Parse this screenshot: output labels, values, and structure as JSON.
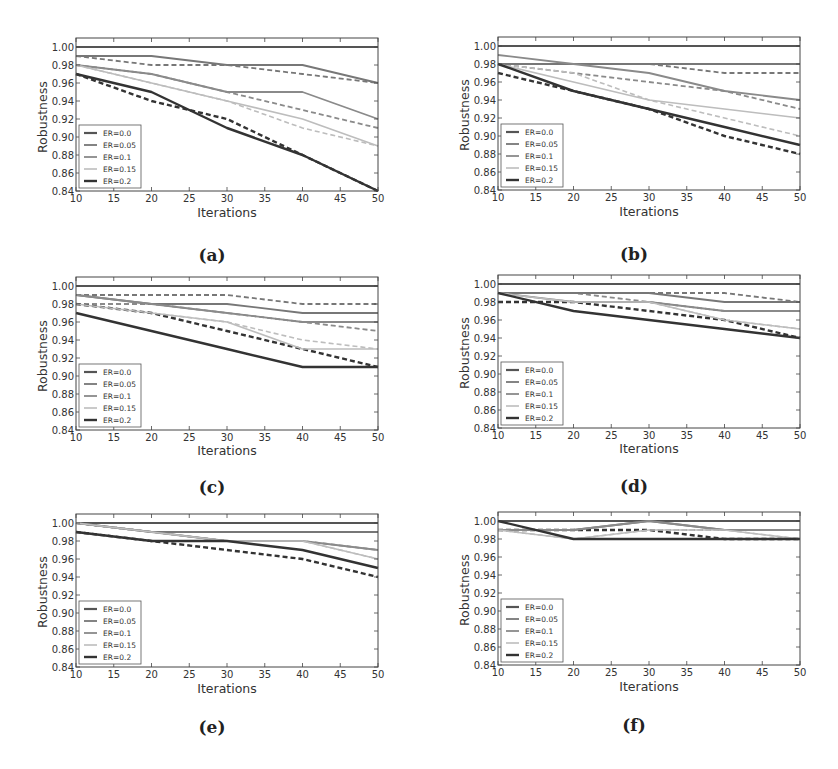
{
  "figure": {
    "panels": [
      "a",
      "b",
      "c",
      "d",
      "e",
      "f"
    ]
  },
  "styles": {
    "series_colors": {
      "ER=0.0": "#555555",
      "ER=0.05": "#777777",
      "ER=0.1": "#8a8a8a",
      "ER=0.15": "#bdbdbd",
      "ER=0.2": "#333333"
    }
  },
  "chart_data": [
    {
      "id": "a",
      "caption": "(a)",
      "type": "line",
      "title": "",
      "xlabel": "Iterations",
      "ylabel": "Robustness",
      "x": [
        10,
        20,
        30,
        40,
        50
      ],
      "xticks": [
        "10",
        "15",
        "20",
        "25",
        "30",
        "35",
        "40",
        "45",
        "50"
      ],
      "yticks": [
        "0.84",
        "0.86",
        "0.88",
        "0.90",
        "0.92",
        "0.94",
        "0.96",
        "0.98",
        "1.00"
      ],
      "xlim": [
        10,
        50
      ],
      "ylim": [
        0.84,
        1.01
      ],
      "grid": false,
      "legend": {
        "position": "lower left",
        "entries": [
          "ER=0.0",
          "ER=0.05",
          "ER=0.1",
          "ER=0.15",
          "ER=0.2"
        ]
      },
      "series": [
        {
          "name": "ER=0.0",
          "style": "solid",
          "values": [
            1.0,
            1.0,
            1.0,
            1.0,
            1.0
          ]
        },
        {
          "name": "ER=0.0",
          "style": "dashed",
          "values": [
            1.0,
            1.0,
            1.0,
            1.0,
            1.0
          ]
        },
        {
          "name": "ER=0.05",
          "style": "solid",
          "values": [
            0.99,
            0.99,
            0.98,
            0.98,
            0.96
          ]
        },
        {
          "name": "ER=0.05",
          "style": "dashed",
          "values": [
            0.99,
            0.98,
            0.98,
            0.97,
            0.96
          ]
        },
        {
          "name": "ER=0.1",
          "style": "solid",
          "values": [
            0.98,
            0.97,
            0.95,
            0.95,
            0.92
          ]
        },
        {
          "name": "ER=0.1",
          "style": "dashed",
          "values": [
            0.98,
            0.97,
            0.95,
            0.93,
            0.91
          ]
        },
        {
          "name": "ER=0.15",
          "style": "solid",
          "values": [
            0.98,
            0.96,
            0.94,
            0.92,
            0.89
          ]
        },
        {
          "name": "ER=0.15",
          "style": "dashed",
          "values": [
            0.98,
            0.96,
            0.94,
            0.91,
            0.89
          ]
        },
        {
          "name": "ER=0.2",
          "style": "solid",
          "values": [
            0.97,
            0.95,
            0.91,
            0.88,
            0.84
          ]
        },
        {
          "name": "ER=0.2",
          "style": "dashed",
          "values": [
            0.97,
            0.94,
            0.92,
            0.88,
            0.84
          ]
        }
      ]
    },
    {
      "id": "b",
      "caption": "(b)",
      "type": "line",
      "title": "",
      "xlabel": "Iterations",
      "ylabel": "Robustness",
      "x": [
        10,
        20,
        30,
        40,
        50
      ],
      "xticks": [
        "10",
        "15",
        "20",
        "25",
        "30",
        "35",
        "40",
        "45",
        "50"
      ],
      "yticks": [
        "0.84",
        "0.86",
        "0.88",
        "0.90",
        "0.92",
        "0.94",
        "0.96",
        "0.98",
        "1.00"
      ],
      "xlim": [
        10,
        50
      ],
      "ylim": [
        0.84,
        1.01
      ],
      "grid": false,
      "legend": {
        "position": "lower left",
        "entries": [
          "ER=0.0",
          "ER=0.05",
          "ER=0.1",
          "ER=0.15",
          "ER=0.2"
        ]
      },
      "series": [
        {
          "name": "ER=0.0",
          "style": "solid",
          "values": [
            1.0,
            1.0,
            1.0,
            1.0,
            1.0
          ]
        },
        {
          "name": "ER=0.0",
          "style": "dashed",
          "values": [
            1.0,
            1.0,
            1.0,
            1.0,
            1.0
          ]
        },
        {
          "name": "ER=0.05",
          "style": "solid",
          "values": [
            0.98,
            0.98,
            0.98,
            0.98,
            0.98
          ]
        },
        {
          "name": "ER=0.05",
          "style": "dashed",
          "values": [
            0.98,
            0.98,
            0.98,
            0.97,
            0.97
          ]
        },
        {
          "name": "ER=0.1",
          "style": "solid",
          "values": [
            0.99,
            0.98,
            0.97,
            0.95,
            0.94
          ]
        },
        {
          "name": "ER=0.1",
          "style": "dashed",
          "values": [
            0.98,
            0.97,
            0.96,
            0.95,
            0.93
          ]
        },
        {
          "name": "ER=0.15",
          "style": "solid",
          "values": [
            0.98,
            0.96,
            0.94,
            0.93,
            0.92
          ]
        },
        {
          "name": "ER=0.15",
          "style": "dashed",
          "values": [
            0.98,
            0.97,
            0.94,
            0.92,
            0.9
          ]
        },
        {
          "name": "ER=0.2",
          "style": "solid",
          "values": [
            0.98,
            0.95,
            0.93,
            0.91,
            0.89
          ]
        },
        {
          "name": "ER=0.2",
          "style": "dashed",
          "values": [
            0.97,
            0.95,
            0.93,
            0.9,
            0.88
          ]
        }
      ]
    },
    {
      "id": "c",
      "caption": "(c)",
      "type": "line",
      "title": "",
      "xlabel": "Iterations",
      "ylabel": "Robustness",
      "x": [
        10,
        20,
        30,
        40,
        50
      ],
      "xticks": [
        "10",
        "15",
        "20",
        "25",
        "30",
        "35",
        "40",
        "45",
        "50"
      ],
      "yticks": [
        "0.84",
        "0.86",
        "0.88",
        "0.90",
        "0.92",
        "0.94",
        "0.96",
        "0.98",
        "1.00"
      ],
      "xlim": [
        10,
        50
      ],
      "ylim": [
        0.84,
        1.01
      ],
      "grid": false,
      "legend": {
        "position": "lower left",
        "entries": [
          "ER=0.0",
          "ER=0.05",
          "ER=0.1",
          "ER=0.15",
          "ER=0.2"
        ]
      },
      "series": [
        {
          "name": "ER=0.0",
          "style": "solid",
          "values": [
            1.0,
            1.0,
            1.0,
            1.0,
            1.0
          ]
        },
        {
          "name": "ER=0.0",
          "style": "dashed",
          "values": [
            1.0,
            1.0,
            1.0,
            1.0,
            1.0
          ]
        },
        {
          "name": "ER=0.05",
          "style": "solid",
          "values": [
            0.99,
            0.98,
            0.98,
            0.97,
            0.97
          ]
        },
        {
          "name": "ER=0.05",
          "style": "dashed",
          "values": [
            0.99,
            0.99,
            0.99,
            0.98,
            0.98
          ]
        },
        {
          "name": "ER=0.1",
          "style": "solid",
          "values": [
            0.99,
            0.98,
            0.97,
            0.96,
            0.96
          ]
        },
        {
          "name": "ER=0.1",
          "style": "dashed",
          "values": [
            0.98,
            0.98,
            0.97,
            0.96,
            0.95
          ]
        },
        {
          "name": "ER=0.15",
          "style": "solid",
          "values": [
            0.98,
            0.97,
            0.96,
            0.93,
            0.93
          ]
        },
        {
          "name": "ER=0.15",
          "style": "dashed",
          "values": [
            0.98,
            0.97,
            0.96,
            0.94,
            0.93
          ]
        },
        {
          "name": "ER=0.2",
          "style": "solid",
          "values": [
            0.97,
            0.95,
            0.93,
            0.91,
            0.91
          ]
        },
        {
          "name": "ER=0.2",
          "style": "dashed",
          "values": [
            0.98,
            0.97,
            0.95,
            0.93,
            0.91
          ]
        }
      ]
    },
    {
      "id": "d",
      "caption": "(d)",
      "type": "line",
      "title": "",
      "xlabel": "Iterations",
      "ylabel": "Robustness",
      "x": [
        10,
        20,
        30,
        40,
        50
      ],
      "xticks": [
        "10",
        "15",
        "20",
        "25",
        "30",
        "35",
        "40",
        "45",
        "50"
      ],
      "yticks": [
        "0.84",
        "0.86",
        "0.88",
        "0.90",
        "0.92",
        "0.94",
        "0.96",
        "0.98",
        "1.00"
      ],
      "xlim": [
        10,
        50
      ],
      "ylim": [
        0.84,
        1.01
      ],
      "grid": false,
      "legend": {
        "position": "lower left",
        "entries": [
          "ER=0.0",
          "ER=0.05",
          "ER=0.1",
          "ER=0.15",
          "ER=0.2"
        ]
      },
      "series": [
        {
          "name": "ER=0.0",
          "style": "solid",
          "values": [
            1.0,
            1.0,
            1.0,
            1.0,
            1.0
          ]
        },
        {
          "name": "ER=0.0",
          "style": "dashed",
          "values": [
            1.0,
            1.0,
            1.0,
            1.0,
            1.0
          ]
        },
        {
          "name": "ER=0.05",
          "style": "solid",
          "values": [
            0.99,
            0.99,
            0.99,
            0.98,
            0.98
          ]
        },
        {
          "name": "ER=0.05",
          "style": "dashed",
          "values": [
            0.99,
            0.99,
            0.99,
            0.99,
            0.98
          ]
        },
        {
          "name": "ER=0.1",
          "style": "solid",
          "values": [
            0.99,
            0.98,
            0.98,
            0.97,
            0.97
          ]
        },
        {
          "name": "ER=0.1",
          "style": "dashed",
          "values": [
            0.99,
            0.99,
            0.98,
            0.97,
            0.97
          ]
        },
        {
          "name": "ER=0.15",
          "style": "solid",
          "values": [
            0.99,
            0.98,
            0.98,
            0.96,
            0.95
          ]
        },
        {
          "name": "ER=0.15",
          "style": "dashed",
          "values": [
            0.99,
            0.98,
            0.98,
            0.96,
            0.95
          ]
        },
        {
          "name": "ER=0.2",
          "style": "solid",
          "values": [
            0.99,
            0.97,
            0.96,
            0.95,
            0.94
          ]
        },
        {
          "name": "ER=0.2",
          "style": "dashed",
          "values": [
            0.98,
            0.98,
            0.97,
            0.96,
            0.94
          ]
        }
      ]
    },
    {
      "id": "e",
      "caption": "(e)",
      "type": "line",
      "title": "",
      "xlabel": "Iterations",
      "ylabel": "Robustness",
      "x": [
        10,
        20,
        30,
        40,
        50
      ],
      "xticks": [
        "10",
        "15",
        "20",
        "25",
        "30",
        "35",
        "40",
        "45",
        "50"
      ],
      "yticks": [
        "0.84",
        "0.86",
        "0.88",
        "0.90",
        "0.92",
        "0.94",
        "0.96",
        "0.98",
        "1.00"
      ],
      "xlim": [
        10,
        50
      ],
      "ylim": [
        0.84,
        1.01
      ],
      "grid": false,
      "legend": {
        "position": "lower left",
        "entries": [
          "ER=0.0",
          "ER=0.05",
          "ER=0.1",
          "ER=0.15",
          "ER=0.2"
        ]
      },
      "series": [
        {
          "name": "ER=0.0",
          "style": "solid",
          "values": [
            1.0,
            1.0,
            1.0,
            1.0,
            1.0
          ]
        },
        {
          "name": "ER=0.0",
          "style": "dashed",
          "values": [
            1.0,
            1.0,
            1.0,
            1.0,
            1.0
          ]
        },
        {
          "name": "ER=0.05",
          "style": "solid",
          "values": [
            1.0,
            0.99,
            0.99,
            0.99,
            0.99
          ]
        },
        {
          "name": "ER=0.05",
          "style": "dashed",
          "values": [
            1.0,
            0.99,
            0.99,
            0.99,
            0.99
          ]
        },
        {
          "name": "ER=0.1",
          "style": "solid",
          "values": [
            1.0,
            0.99,
            0.98,
            0.98,
            0.97
          ]
        },
        {
          "name": "ER=0.1",
          "style": "dashed",
          "values": [
            1.0,
            0.99,
            0.98,
            0.98,
            0.97
          ]
        },
        {
          "name": "ER=0.15",
          "style": "solid",
          "values": [
            1.0,
            0.99,
            0.98,
            0.98,
            0.96
          ]
        },
        {
          "name": "ER=0.15",
          "style": "dashed",
          "values": [
            1.0,
            0.99,
            0.98,
            0.98,
            0.96
          ]
        },
        {
          "name": "ER=0.2",
          "style": "solid",
          "values": [
            0.99,
            0.98,
            0.98,
            0.97,
            0.95
          ]
        },
        {
          "name": "ER=0.2",
          "style": "dashed",
          "values": [
            0.99,
            0.98,
            0.97,
            0.96,
            0.94
          ]
        }
      ]
    },
    {
      "id": "f",
      "caption": "(f)",
      "type": "line",
      "title": "",
      "xlabel": "Iterations",
      "ylabel": "Robustness",
      "x": [
        10,
        20,
        30,
        40,
        50
      ],
      "xticks": [
        "10",
        "15",
        "20",
        "25",
        "30",
        "35",
        "40",
        "45",
        "50"
      ],
      "yticks": [
        "0.84",
        "0.86",
        "0.88",
        "0.90",
        "0.92",
        "0.94",
        "0.96",
        "0.98",
        "1.00"
      ],
      "xlim": [
        10,
        50
      ],
      "ylim": [
        0.84,
        1.01
      ],
      "grid": false,
      "legend": {
        "position": "lower left",
        "entries": [
          "ER=0.0",
          "ER=0.05",
          "ER=0.1",
          "ER=0.15",
          "ER=0.2"
        ]
      },
      "series": [
        {
          "name": "ER=0.0",
          "style": "solid",
          "values": [
            1.0,
            1.0,
            1.0,
            1.0,
            1.0
          ]
        },
        {
          "name": "ER=0.0",
          "style": "dashed",
          "values": [
            1.0,
            1.0,
            1.0,
            1.0,
            1.0
          ]
        },
        {
          "name": "ER=0.05",
          "style": "solid",
          "values": [
            0.99,
            0.99,
            1.0,
            0.99,
            0.99
          ]
        },
        {
          "name": "ER=0.05",
          "style": "dashed",
          "values": [
            0.99,
            0.99,
            0.99,
            0.99,
            0.99
          ]
        },
        {
          "name": "ER=0.1",
          "style": "solid",
          "values": [
            0.99,
            0.99,
            1.0,
            0.99,
            0.99
          ]
        },
        {
          "name": "ER=0.1",
          "style": "dashed",
          "values": [
            0.99,
            0.99,
            0.99,
            0.99,
            0.99
          ]
        },
        {
          "name": "ER=0.15",
          "style": "solid",
          "values": [
            0.99,
            0.98,
            0.99,
            0.99,
            0.98
          ]
        },
        {
          "name": "ER=0.15",
          "style": "dashed",
          "values": [
            0.99,
            0.98,
            0.99,
            0.99,
            0.98
          ]
        },
        {
          "name": "ER=0.2",
          "style": "solid",
          "values": [
            1.0,
            0.98,
            0.98,
            0.98,
            0.98
          ]
        },
        {
          "name": "ER=0.2",
          "style": "dashed",
          "values": [
            0.99,
            0.99,
            0.99,
            0.98,
            0.98
          ]
        }
      ]
    }
  ]
}
